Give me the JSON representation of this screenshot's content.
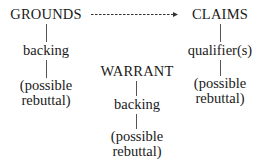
{
  "diagram": {
    "type": "Toulmin argument model",
    "grounds": {
      "label": "GROUNDS",
      "children": [
        "backing",
        "(possible",
        "rebuttal)"
      ]
    },
    "claims": {
      "label": "CLAIMS",
      "children": [
        "qualifier(s)",
        "(possible",
        "rebuttal)"
      ]
    },
    "warrant": {
      "label": "WARRANT",
      "children": [
        "backing",
        "(possible",
        "rebuttal)"
      ]
    },
    "edges": [
      {
        "from": "GROUNDS",
        "to": "CLAIMS",
        "style": "dashed-arrow"
      }
    ]
  }
}
